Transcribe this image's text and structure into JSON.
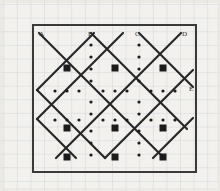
{
  "figure": {
    "background_color": "#f2f1ee",
    "graph_paper": {
      "grid_color": "#b9c3cf",
      "grid_spacing_px": 13.6,
      "minor_grid": true
    },
    "border_box": {
      "stroke_color": "#3a3a3a",
      "stroke_width_px": 2,
      "x": 33,
      "y": 25,
      "width": 163,
      "height": 147
    },
    "lattice": {
      "line_color": "#262626",
      "line_width_px": 2.2,
      "node_color": "#1c1c1c",
      "node_size_px": 7,
      "dot_color": "#1c1c1c",
      "dot_radius_px": 1.6,
      "columns_x": [
        43,
        67,
        91,
        115,
        139,
        163,
        187
      ],
      "rows_y": [
        39,
        68,
        91,
        120,
        134,
        157
      ],
      "square_nodes": [
        {
          "x": 67,
          "y": 68
        },
        {
          "x": 115,
          "y": 68
        },
        {
          "x": 163,
          "y": 68
        },
        {
          "x": 67,
          "y": 128
        },
        {
          "x": 115,
          "y": 128
        },
        {
          "x": 163,
          "y": 128
        },
        {
          "x": 67,
          "y": 157
        },
        {
          "x": 115,
          "y": 157
        },
        {
          "x": 163,
          "y": 157
        }
      ]
    },
    "labels": [
      {
        "id": "label-a",
        "text": "A",
        "x": 39,
        "y": 31
      },
      {
        "id": "label-b",
        "text": "B",
        "x": 88,
        "y": 31
      },
      {
        "id": "label-c",
        "text": "C",
        "x": 135,
        "y": 31
      },
      {
        "id": "label-d",
        "text": "D",
        "x": 182,
        "y": 31
      },
      {
        "id": "label-e",
        "text": "E",
        "x": 189,
        "y": 88
      }
    ]
  }
}
